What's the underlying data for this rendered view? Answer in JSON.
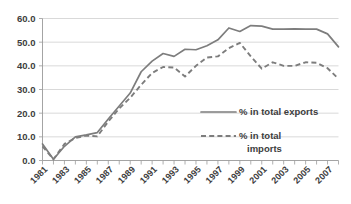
{
  "chart_data": {
    "type": "line",
    "title": "",
    "subtitle": "",
    "xlabel": "",
    "ylabel": "",
    "xlim": [
      1981,
      2008
    ],
    "ylim": [
      0.0,
      60.0
    ],
    "grid": true,
    "legend_position": "inside-right",
    "y_ticks": [
      "0.0",
      "10.0",
      "20.0",
      "30.0",
      "40.0",
      "50.0",
      "60.0"
    ],
    "y_tick_values": [
      0.0,
      10.0,
      20.0,
      30.0,
      40.0,
      50.0,
      60.0
    ],
    "x": [
      1981,
      1982,
      1983,
      1984,
      1985,
      1986,
      1987,
      1988,
      1989,
      1990,
      1991,
      1992,
      1993,
      1994,
      1995,
      1996,
      1997,
      1998,
      1999,
      2000,
      2001,
      2002,
      2003,
      2004,
      2005,
      2006,
      2007,
      2008
    ],
    "x_tick_labels": [
      "1981",
      "1983",
      "1985",
      "1987",
      "1989",
      "1991",
      "1993",
      "1995",
      "1997",
      "1999",
      "2001",
      "2003",
      "2005",
      "2007"
    ],
    "x_tick_values": [
      1981,
      1983,
      1985,
      1987,
      1989,
      1991,
      1993,
      1995,
      1997,
      1999,
      2001,
      2003,
      2005,
      2007
    ],
    "series": [
      {
        "name": "% in total exports",
        "style": "solid",
        "color": "#7d7d7d",
        "values": [
          7.0,
          0.5,
          6.0,
          10.0,
          10.8,
          11.8,
          17.5,
          23.0,
          28.5,
          37.5,
          42.0,
          45.2,
          44.0,
          47.0,
          46.8,
          48.5,
          51.0,
          56.0,
          54.5,
          57.0,
          56.8,
          55.5,
          55.5,
          55.6,
          55.5,
          55.5,
          53.5,
          48.0
        ]
      },
      {
        "name": "% in total imports",
        "style": "dashed",
        "color": "#7d7d7d",
        "values": [
          6.0,
          0.5,
          7.0,
          9.5,
          10.5,
          10.2,
          16.5,
          22.0,
          26.5,
          32.0,
          37.0,
          39.5,
          39.3,
          35.5,
          40.0,
          43.5,
          44.0,
          47.5,
          49.7,
          44.0,
          38.8,
          41.5,
          40.0,
          40.0,
          41.5,
          41.3,
          39.0,
          34.5
        ]
      }
    ],
    "legend": [
      {
        "label": "% in total exports",
        "style": "solid"
      },
      {
        "label_line1": "% in total",
        "label_line2": "imports",
        "style": "dashed"
      }
    ]
  }
}
